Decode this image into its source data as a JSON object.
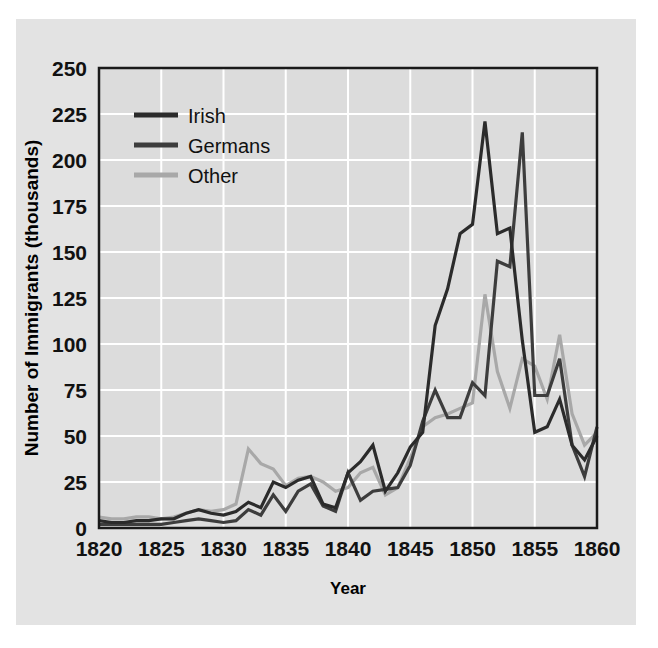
{
  "figure": {
    "background_color": "#e3e3e3",
    "page_color": "#ffffff",
    "plot_background": "#dcdcdc",
    "grid_color": "#ffffff",
    "frame_color": "#1a1a1a"
  },
  "axes": {
    "ylabel": "Number of Immigrants (thousands)",
    "xlabel": "Year",
    "yticks": [
      "0",
      "25",
      "50",
      "75",
      "100",
      "125",
      "150",
      "175",
      "200",
      "225",
      "250"
    ],
    "xticks": [
      "1820",
      "1825",
      "1830",
      "1835",
      "1840",
      "1845",
      "1850",
      "1855",
      "1860"
    ]
  },
  "legend": {
    "position": "upper-left-inside",
    "entries": [
      {
        "label": "Irish",
        "color": "#2b2b2b"
      },
      {
        "label": "Germans",
        "color": "#3d3d3d"
      },
      {
        "label": "Other",
        "color": "#a8a8a8"
      }
    ]
  },
  "chart_data": {
    "type": "line",
    "title": "",
    "xlabel": "Year",
    "ylabel": "Number of Immigrants (thousands)",
    "xlim": [
      1820,
      1860
    ],
    "ylim": [
      0,
      250
    ],
    "xtick_step": 5,
    "ytick_step": 25,
    "grid": true,
    "legend_position": "upper-left-inside",
    "x": [
      1820,
      1821,
      1822,
      1823,
      1824,
      1825,
      1826,
      1827,
      1828,
      1829,
      1830,
      1831,
      1832,
      1833,
      1834,
      1835,
      1836,
      1837,
      1838,
      1839,
      1840,
      1841,
      1842,
      1843,
      1844,
      1845,
      1846,
      1847,
      1848,
      1849,
      1850,
      1851,
      1852,
      1853,
      1854,
      1855,
      1856,
      1857,
      1858,
      1859,
      1860
    ],
    "series": [
      {
        "name": "Irish",
        "color": "#2b2b2b",
        "values": [
          4,
          3,
          3,
          4,
          4,
          5,
          5,
          8,
          10,
          8,
          7,
          9,
          14,
          11,
          25,
          22,
          26,
          28,
          13,
          11,
          30,
          36,
          45,
          20,
          30,
          44,
          52,
          110,
          130,
          160,
          165,
          221,
          160,
          163,
          102,
          52,
          55,
          70,
          45,
          37,
          50
        ]
      },
      {
        "name": "Germans",
        "color": "#3d3d3d",
        "values": [
          2,
          2,
          2,
          2,
          2,
          2,
          3,
          4,
          5,
          4,
          3,
          4,
          10,
          7,
          18,
          9,
          20,
          24,
          12,
          9,
          30,
          15,
          20,
          21,
          22,
          34,
          58,
          75,
          60,
          60,
          79,
          72,
          145,
          142,
          215,
          72,
          72,
          92,
          45,
          28,
          55
        ]
      },
      {
        "name": "Other",
        "color": "#a8a8a8",
        "values": [
          6,
          5,
          5,
          6,
          6,
          5,
          6,
          8,
          10,
          9,
          10,
          13,
          43,
          35,
          32,
          23,
          27,
          28,
          25,
          20,
          22,
          30,
          33,
          18,
          22,
          38,
          55,
          60,
          62,
          65,
          68,
          127,
          85,
          65,
          92,
          88,
          70,
          105,
          62,
          45,
          52
        ]
      }
    ]
  }
}
